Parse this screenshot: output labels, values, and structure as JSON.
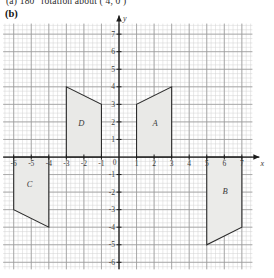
{
  "header": {
    "cut_off_line": "(a)   180° rotation about ( 4, 0 )",
    "part_label": "(b)"
  },
  "chart_data": {
    "type": "scatter",
    "title": "",
    "xlabel": "x",
    "ylabel": "y",
    "grid": true,
    "minor_grid": true,
    "xlim": [
      -6.6,
      7.6
    ],
    "ylim": [
      -6.4,
      7.6
    ],
    "xticks": [
      -6,
      -5,
      -4,
      -3,
      -2,
      -1,
      0,
      1,
      2,
      3,
      4,
      5,
      6,
      7
    ],
    "yticks": [
      -6,
      -5,
      -4,
      -3,
      -2,
      -1,
      0,
      1,
      2,
      3,
      4,
      5,
      6,
      7
    ],
    "xticklabels": [
      "-6",
      "-5",
      "-4",
      "-3",
      "-2",
      "-1",
      "0",
      "1",
      "2",
      "3",
      "4",
      "5",
      "6",
      "7"
    ],
    "yticklabels": [
      "-6",
      "-5",
      "-4",
      "-3",
      "-2",
      "-1",
      "0",
      "1",
      "2",
      "3",
      "4",
      "5",
      "6",
      "7"
    ],
    "axis_arrow_x_label": "x",
    "axis_arrow_y_label": "y",
    "shapes": [
      {
        "name": "A",
        "label": "A",
        "label_pos": [
          2.05,
          1.75
        ],
        "points": [
          [
            1,
            0
          ],
          [
            3,
            0
          ],
          [
            3,
            4
          ],
          [
            1,
            3
          ]
        ],
        "fill": "#e9e9e7",
        "stroke": "#2d2d2d"
      },
      {
        "name": "B",
        "label": "B",
        "label_pos": [
          6.05,
          -2.1
        ],
        "points": [
          [
            5,
            0
          ],
          [
            7,
            0
          ],
          [
            7,
            -4
          ],
          [
            5,
            -5
          ]
        ],
        "fill": "#ebebe9",
        "stroke": "#2d2d2d"
      },
      {
        "name": "C",
        "label": "C",
        "label_pos": [
          -5.1,
          -1.7
        ],
        "points": [
          [
            -6,
            0
          ],
          [
            -4,
            0
          ],
          [
            -4,
            -4
          ],
          [
            -6,
            -3
          ]
        ],
        "fill": "#eaeae8",
        "stroke": "#2d2d2d"
      },
      {
        "name": "D",
        "label": "D",
        "label_pos": [
          -2.15,
          1.75
        ],
        "points": [
          [
            -3,
            0
          ],
          [
            -1,
            0
          ],
          [
            -1,
            3
          ],
          [
            -3,
            4
          ]
        ],
        "fill": "#e9e9e7",
        "stroke": "#2d2d2d"
      }
    ],
    "colors": {
      "major_grid": "#9a9a9a",
      "minor_grid": "#d2d2d2",
      "axis": "#1b1b1b",
      "shape_fill": "#e9e9e7",
      "shape_stroke": "#2d2d2d",
      "tick_label": "#3a3a3a"
    }
  }
}
